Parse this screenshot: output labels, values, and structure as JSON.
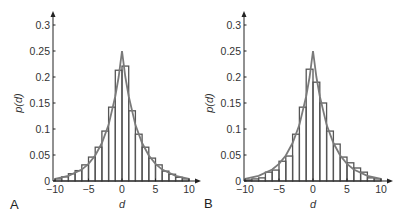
{
  "figure": {
    "panels": [
      "A",
      "B"
    ]
  },
  "chart_data": [
    {
      "type": "bar",
      "panel_label": "A",
      "title": "",
      "xlabel": "d",
      "ylabel": "p(d)",
      "xlim": [
        -10,
        10
      ],
      "ylim": [
        0,
        0.3
      ],
      "xticks": [
        -10,
        -5,
        0,
        5,
        10
      ],
      "xtick_labels": [
        "−10",
        "−5",
        "0",
        "5",
        "10"
      ],
      "yticks": [
        0,
        0.05,
        0.1,
        0.15,
        0.2,
        0.25,
        0.3
      ],
      "ytick_labels": [
        "0",
        "0.05",
        "0.1",
        "0.15",
        "0.2",
        "0.25",
        "0.3"
      ],
      "grid": false,
      "bin_edges": [
        -10,
        -9,
        -8,
        -7,
        -6,
        -5,
        -4,
        -3,
        -2,
        -1,
        0,
        1,
        2,
        3,
        4,
        5,
        6,
        7,
        8,
        9,
        10
      ],
      "series": [
        {
          "name": "histogram",
          "type": "bar",
          "values": [
            0.004,
            0.008,
            0.014,
            0.02,
            0.031,
            0.046,
            0.065,
            0.096,
            0.142,
            0.213,
            0.221,
            0.135,
            0.09,
            0.065,
            0.044,
            0.031,
            0.019,
            0.013,
            0.007,
            0.004
          ]
        },
        {
          "name": "fitted-curve",
          "type": "line",
          "x": [
            -10,
            -8,
            -6,
            -5,
            -4,
            -3,
            -2,
            -1,
            -0.5,
            0,
            0.5,
            1,
            2,
            3,
            4,
            5,
            6,
            8,
            10
          ],
          "y": [
            0.004,
            0.01,
            0.022,
            0.033,
            0.049,
            0.073,
            0.108,
            0.163,
            0.2,
            0.25,
            0.2,
            0.163,
            0.108,
            0.073,
            0.049,
            0.033,
            0.022,
            0.01,
            0.004
          ]
        }
      ]
    },
    {
      "type": "bar",
      "panel_label": "B",
      "title": "",
      "xlabel": "d",
      "ylabel": "p(d)",
      "xlim": [
        -10,
        10
      ],
      "ylim": [
        0,
        0.3
      ],
      "xticks": [
        -10,
        -5,
        0,
        5,
        10
      ],
      "xtick_labels": [
        "−10",
        "−5",
        "0",
        "5",
        "10"
      ],
      "yticks": [
        0,
        0.05,
        0.1,
        0.15,
        0.2,
        0.25,
        0.3
      ],
      "ytick_labels": [
        "0",
        "0.05",
        "0.1",
        "0.15",
        "0.2",
        "0.25",
        "0.3"
      ],
      "grid": false,
      "bin_edges": [
        -10,
        -9,
        -8,
        -7,
        -6,
        -5,
        -4,
        -3,
        -2,
        -1,
        0,
        1,
        2,
        3,
        4,
        5,
        6,
        7,
        8,
        9,
        10
      ],
      "series": [
        {
          "name": "histogram",
          "type": "bar",
          "values": [
            0.002,
            0.004,
            0.006,
            0.017,
            0.021,
            0.038,
            0.048,
            0.09,
            0.142,
            0.215,
            0.19,
            0.15,
            0.096,
            0.071,
            0.046,
            0.035,
            0.025,
            0.017,
            0.006,
            0.004
          ]
        },
        {
          "name": "fitted-curve",
          "type": "line",
          "x": [
            -10,
            -8,
            -6,
            -5,
            -4,
            -3,
            -2,
            -1,
            -0.5,
            0,
            0.5,
            1,
            2,
            3,
            4,
            5,
            6,
            8,
            10
          ],
          "y": [
            0.004,
            0.01,
            0.022,
            0.033,
            0.049,
            0.073,
            0.108,
            0.163,
            0.2,
            0.25,
            0.2,
            0.163,
            0.108,
            0.073,
            0.049,
            0.033,
            0.022,
            0.01,
            0.004
          ]
        }
      ]
    }
  ],
  "style": {
    "bar_stroke": "#555555",
    "curve_stroke": "#7a7a7a",
    "axis_color": "#222222"
  }
}
